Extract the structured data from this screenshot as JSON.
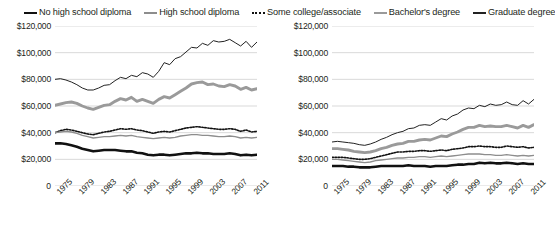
{
  "legend": {
    "items": [
      {
        "label": "No high school diploma",
        "style": "thick-black",
        "color": "#111111"
      },
      {
        "label": "High school diploma",
        "style": "thin-gray",
        "color": "#8d8d8d"
      },
      {
        "label": "Some college/associate",
        "style": "dotted-black",
        "color": "#111111"
      },
      {
        "label": "Bachelor's degree",
        "style": "thick-gray",
        "color": "#9a9a9a"
      },
      {
        "label": "Graduate degree",
        "style": "thin-black",
        "color": "#222222"
      }
    ]
  },
  "axis": {
    "y_ticks": [
      "$120,000",
      "$100,000",
      "$80,000",
      "$60,000",
      "$40,000",
      "$20,000"
    ],
    "y_zero": "0",
    "x_ticks": [
      "1975",
      "1979",
      "1983",
      "1987",
      "1991",
      "1995",
      "1999",
      "2003",
      "2007",
      "2011"
    ]
  },
  "chart_data": [
    {
      "type": "line",
      "title": "",
      "xlabel": "",
      "ylabel": "",
      "ylim": [
        0,
        120000
      ],
      "xlim": [
        1975,
        2012
      ],
      "grid": true,
      "legend_position": "top-shared",
      "x": [
        1975,
        1976,
        1977,
        1978,
        1979,
        1980,
        1981,
        1982,
        1983,
        1984,
        1985,
        1986,
        1987,
        1988,
        1989,
        1990,
        1991,
        1992,
        1993,
        1994,
        1995,
        1996,
        1997,
        1998,
        1999,
        2000,
        2001,
        2002,
        2003,
        2004,
        2005,
        2006,
        2007,
        2008,
        2009,
        2010,
        2011,
        2012
      ],
      "series": [
        {
          "name": "Graduate degree",
          "values": [
            80000,
            80500,
            79500,
            78000,
            76000,
            73500,
            72000,
            72000,
            73500,
            75500,
            76000,
            79000,
            81500,
            80500,
            83000,
            82000,
            85000,
            84000,
            81500,
            86000,
            92500,
            91000,
            95500,
            97000,
            100500,
            104000,
            103500,
            107000,
            105500,
            109000,
            108000,
            108500,
            110000,
            107500,
            105000,
            108500,
            104000,
            108000
          ]
        },
        {
          "name": "Bachelor's degree",
          "values": [
            60500,
            61500,
            62500,
            63000,
            62000,
            60000,
            58500,
            57500,
            59000,
            60500,
            61000,
            63500,
            65500,
            64500,
            66500,
            63500,
            65000,
            63500,
            62000,
            65000,
            67000,
            66000,
            68500,
            71000,
            73500,
            76500,
            77500,
            78000,
            76000,
            76500,
            75000,
            74500,
            76000,
            75000,
            72500,
            74000,
            72000,
            73000
          ]
        },
        {
          "name": "Some college/associate",
          "values": [
            40000,
            41500,
            42500,
            42000,
            41000,
            40000,
            39000,
            38500,
            39500,
            40500,
            41000,
            42000,
            43000,
            42500,
            43000,
            42000,
            41500,
            40500,
            39500,
            40500,
            41000,
            40500,
            41500,
            42500,
            43500,
            44000,
            44500,
            44000,
            43500,
            43000,
            42500,
            42500,
            43000,
            42500,
            41000,
            42000,
            40500,
            41000
          ]
        },
        {
          "name": "High school diploma",
          "values": [
            40000,
            40500,
            41000,
            40500,
            39500,
            38000,
            37000,
            36000,
            36500,
            37000,
            37000,
            37500,
            38000,
            37500,
            38000,
            37000,
            36500,
            36000,
            35500,
            36000,
            36500,
            36000,
            36500,
            37500,
            38000,
            38500,
            38500,
            38000,
            38000,
            37500,
            37000,
            37000,
            37500,
            37000,
            36000,
            36500,
            36000,
            36500
          ]
        },
        {
          "name": "No high school diploma",
          "values": [
            32000,
            32000,
            31500,
            30500,
            29500,
            28000,
            27000,
            26000,
            26500,
            27000,
            27000,
            27000,
            26500,
            26000,
            26000,
            25000,
            24500,
            23500,
            23000,
            23500,
            23500,
            23000,
            23500,
            24000,
            24500,
            24500,
            25000,
            24500,
            24500,
            24000,
            24000,
            24000,
            24500,
            24000,
            23000,
            23500,
            23000,
            23500
          ]
        }
      ]
    },
    {
      "type": "line",
      "title": "",
      "xlabel": "",
      "ylabel": "",
      "ylim": [
        0,
        120000
      ],
      "xlim": [
        1975,
        2012
      ],
      "grid": true,
      "legend_position": "top-shared",
      "x": [
        1975,
        1976,
        1977,
        1978,
        1979,
        1980,
        1981,
        1982,
        1983,
        1984,
        1985,
        1986,
        1987,
        1988,
        1989,
        1990,
        1991,
        1992,
        1993,
        1994,
        1995,
        1996,
        1997,
        1998,
        1999,
        2000,
        2001,
        2002,
        2003,
        2004,
        2005,
        2006,
        2007,
        2008,
        2009,
        2010,
        2011,
        2012
      ],
      "series": [
        {
          "name": "Graduate degree",
          "values": [
            33000,
            33500,
            33000,
            32500,
            32000,
            31000,
            30500,
            31500,
            33000,
            35000,
            36500,
            38500,
            40000,
            41000,
            43000,
            43500,
            45500,
            46000,
            45500,
            48000,
            50500,
            49500,
            52500,
            54000,
            57000,
            58500,
            58000,
            60500,
            59500,
            61500,
            60500,
            61000,
            63000,
            61000,
            60500,
            64000,
            61500,
            65000
          ]
        },
        {
          "name": "Bachelor's degree",
          "values": [
            28000,
            28000,
            27500,
            27000,
            26000,
            25500,
            25000,
            25500,
            26500,
            28000,
            29000,
            30500,
            31500,
            32000,
            33500,
            33500,
            34500,
            35000,
            34500,
            36000,
            37500,
            37000,
            39000,
            40500,
            42500,
            44000,
            44000,
            45500,
            44500,
            45000,
            44500,
            44500,
            45500,
            44500,
            43500,
            45500,
            44000,
            46000
          ]
        },
        {
          "name": "Some college/associate",
          "values": [
            21500,
            21500,
            21500,
            21000,
            20500,
            20000,
            20000,
            20500,
            21500,
            22500,
            23500,
            24500,
            25500,
            25500,
            26000,
            26000,
            26500,
            26500,
            26000,
            26500,
            27000,
            26500,
            27500,
            28000,
            28500,
            29500,
            29500,
            30000,
            29500,
            29500,
            29000,
            29000,
            30000,
            29500,
            29000,
            29500,
            28500,
            29000
          ]
        },
        {
          "name": "High school diploma",
          "values": [
            20000,
            20000,
            19500,
            19000,
            18500,
            18000,
            17500,
            18000,
            19000,
            19500,
            20000,
            20500,
            21000,
            21000,
            21500,
            21500,
            22000,
            22000,
            21500,
            22000,
            22500,
            22000,
            22500,
            23000,
            23500,
            24000,
            24000,
            24000,
            23500,
            23500,
            23000,
            23000,
            23500,
            23000,
            22500,
            23000,
            22500,
            23000
          ]
        },
        {
          "name": "No high school diploma",
          "values": [
            15000,
            15000,
            15000,
            14500,
            14500,
            14000,
            14000,
            14000,
            14500,
            15000,
            15000,
            15000,
            15000,
            15000,
            15500,
            15000,
            15000,
            15000,
            14500,
            15000,
            15000,
            15000,
            15500,
            16000,
            16000,
            16500,
            16500,
            17500,
            17000,
            17500,
            17000,
            17000,
            17500,
            17000,
            16500,
            17000,
            16500,
            16500
          ]
        }
      ]
    }
  ]
}
